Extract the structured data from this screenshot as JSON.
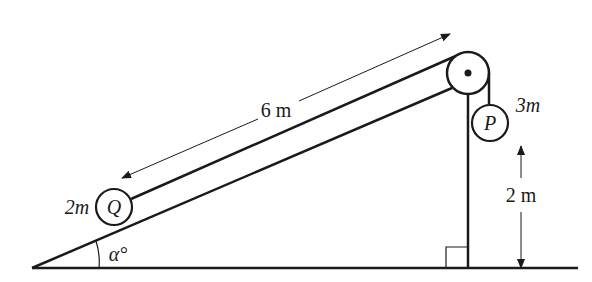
{
  "diagram": {
    "colors": {
      "ink": "#1a1a1a",
      "background": "#ffffff"
    },
    "particles": {
      "Q": {
        "label": "Q",
        "mass_label": "2m"
      },
      "P": {
        "label": "P",
        "mass_label": "3m"
      }
    },
    "dimensions": {
      "slope_length": "6 m",
      "height": "2 m"
    },
    "angle": {
      "label": "α°"
    },
    "pulley": {
      "label": ""
    },
    "right_angle_marker": true
  }
}
